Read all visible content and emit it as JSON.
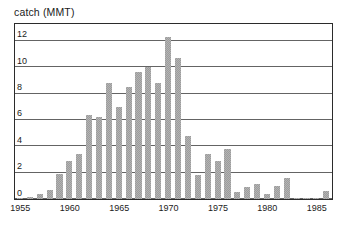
{
  "chart_data": {
    "type": "bar",
    "title": "catch (MMT)",
    "xlabel": "",
    "ylabel": "catch (MMT)",
    "xlim": [
      1954.5,
      1986.5
    ],
    "ylim": [
      0,
      13.2
    ],
    "grid": true,
    "legend": null,
    "bar_color": "#b4b4b4",
    "frame_color": "#2b2b2b",
    "gridline_color": "#646464",
    "y_ticks": [
      0,
      2,
      4,
      6,
      8,
      10,
      12
    ],
    "y_tick_labels": [
      "0",
      "2",
      "4",
      "6",
      "8",
      "10",
      "12"
    ],
    "x_ticks": [
      1955,
      1960,
      1965,
      1970,
      1975,
      1980,
      1985
    ],
    "x_tick_labels": [
      "1955",
      "1960",
      "1965",
      "1970",
      "1975",
      "1980",
      "1985"
    ],
    "categories": [
      1955,
      1956,
      1957,
      1958,
      1959,
      1960,
      1961,
      1962,
      1963,
      1964,
      1965,
      1966,
      1967,
      1968,
      1969,
      1970,
      1971,
      1972,
      1973,
      1974,
      1975,
      1976,
      1977,
      1978,
      1979,
      1980,
      1981,
      1982,
      1983,
      1984,
      1985,
      1986
    ],
    "values": [
      0.06,
      0.12,
      0.35,
      0.7,
      1.9,
      2.9,
      3.4,
      6.4,
      6.2,
      8.8,
      7.0,
      8.5,
      9.6,
      10.0,
      8.8,
      12.3,
      10.7,
      4.8,
      1.8,
      3.4,
      2.9,
      3.8,
      0.5,
      0.9,
      1.1,
      0.4,
      1.0,
      1.6,
      0.03,
      0.03,
      0.06,
      0.6
    ]
  }
}
